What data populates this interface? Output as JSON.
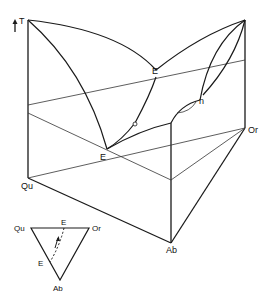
{
  "diagram": {
    "type": "ternary-phase-diagram-3d",
    "axis": {
      "label": "T",
      "arrow": "up"
    },
    "vertices": {
      "qu": "Qu",
      "or": "Or",
      "ab": "Ab"
    },
    "points": {
      "eutectic_top": "E",
      "eutectic_bottom": "E",
      "point_n": "n"
    },
    "inset": {
      "vertices": {
        "qu": "Qu",
        "or": "Or",
        "ab": "Ab"
      },
      "points": {
        "e_top": "E",
        "e_left": "E"
      }
    },
    "colors": {
      "line": "#1a1a1a",
      "background": "#ffffff"
    }
  }
}
